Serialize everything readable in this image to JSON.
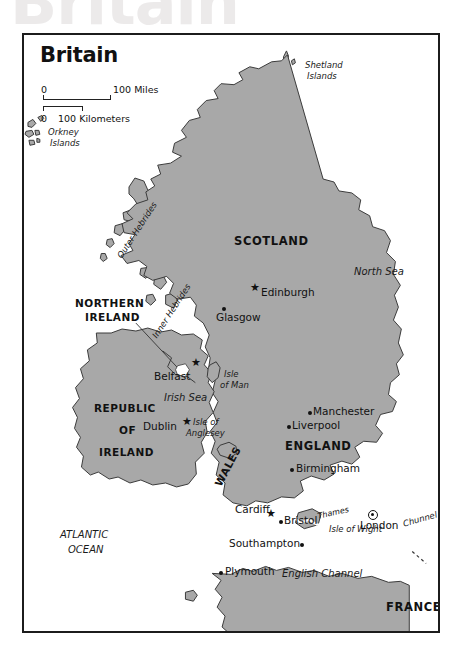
{
  "watermark": {
    "text": "Britain"
  },
  "map": {
    "title": "Britain",
    "scale": {
      "miles": {
        "zero": "0",
        "value": "100",
        "unit": "Miles",
        "label": "100 Miles"
      },
      "kilometers": {
        "zero": "0",
        "value": "100",
        "unit": "Kilometers",
        "label": "100 Kilometers"
      }
    },
    "colors": {
      "land": "#a8a8a8",
      "land_stroke": "#3a3a3a",
      "water": "#ffffff",
      "frame": "#1c1c1c",
      "text": "#111111",
      "watermark": "#eceaea"
    },
    "countries": [
      {
        "name": "SCOTLAND"
      },
      {
        "name": "NORTHERN IRELAND"
      },
      {
        "name": "REPUBLIC OF IRELAND"
      },
      {
        "name": "ENGLAND"
      },
      {
        "name": "WALES"
      },
      {
        "name": "FRANCE"
      }
    ],
    "country_labels": {
      "scotland": "SCOTLAND",
      "northern_ireland_line1": "NORTHERN",
      "northern_ireland_line2": "IRELAND",
      "republic_line1": "REPUBLIC",
      "republic_line2": "OF",
      "republic_line3": "IRELAND",
      "england": "ENGLAND",
      "wales": "WALES",
      "france": "FRANCE"
    },
    "cities": [
      {
        "name": "Edinburgh",
        "symbol": "star"
      },
      {
        "name": "Glasgow",
        "symbol": "dot"
      },
      {
        "name": "Belfast",
        "symbol": "star"
      },
      {
        "name": "Dublin",
        "symbol": "star"
      },
      {
        "name": "Manchester",
        "symbol": "dot"
      },
      {
        "name": "Liverpool",
        "symbol": "dot"
      },
      {
        "name": "Birmingham",
        "symbol": "dot"
      },
      {
        "name": "Cardiff",
        "symbol": "star"
      },
      {
        "name": "Bristol",
        "symbol": "dot"
      },
      {
        "name": "London",
        "symbol": "capital"
      },
      {
        "name": "Southampton",
        "symbol": "dot"
      },
      {
        "name": "Plymouth",
        "symbol": "dot"
      }
    ],
    "city_labels": {
      "edinburgh": "Edinburgh",
      "glasgow": "Glasgow",
      "belfast": "Belfast",
      "dublin": "Dublin",
      "manchester": "Manchester",
      "liverpool": "Liverpool",
      "birmingham": "Birmingham",
      "cardiff": "Cardiff",
      "bristol": "Bristol",
      "london": "London",
      "southampton": "Southampton",
      "plymouth": "Plymouth"
    },
    "water_labels": {
      "north_sea": "North Sea",
      "irish_sea": "Irish Sea",
      "english_channel": "English Channel",
      "atlantic_line1": "ATLANTIC",
      "atlantic_line2": "OCEAN"
    },
    "island_labels": {
      "shetland_line1": "Shetland",
      "shetland_line2": "Islands",
      "orkney_line1": "Orkney",
      "orkney_line2": "Islands",
      "outer_hebrides": "Outer Hebrides",
      "inner_hebrides": "Inner Hebrides",
      "isle_of_man_line1": "Isle",
      "isle_of_man_line2": "of Man",
      "anglesey_line1": "Isle of",
      "anglesey_line2": "Anglesey",
      "isle_of_wight": "Isle of Wight"
    },
    "features": {
      "thames": "Thames",
      "chunnel": "Chunnel"
    }
  }
}
